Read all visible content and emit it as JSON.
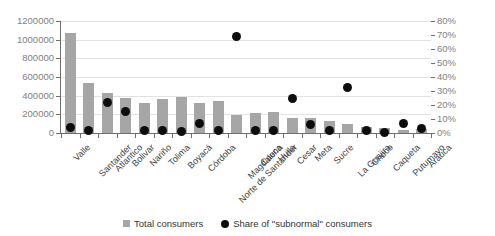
{
  "chart_data": {
    "type": "bar",
    "title": "",
    "subtitle": "",
    "xlabel": "",
    "ylabel": "",
    "y2label": "",
    "grid": true,
    "legend_position": "bottom",
    "categories": [
      "Valle",
      "Santander",
      "Atlantico",
      "Bolivar",
      "Nariño",
      "Tolima",
      "Boyacá",
      "Córdoba",
      "Norte de Santander",
      "Magdalena",
      "Cauca",
      "Huila",
      "Cesar",
      "Meta",
      "Sucre",
      "La Guajira",
      "Choco",
      "Caqueta",
      "Putumayo",
      "Arauca"
    ],
    "ylim": [
      0,
      1200000
    ],
    "yticks": [
      0,
      200000,
      400000,
      600000,
      800000,
      1000000,
      1200000
    ],
    "yticklabels": [
      "0",
      "200000",
      "400000",
      "600000",
      "800000",
      "1000000",
      "1200000"
    ],
    "y2lim": [
      0,
      0.8
    ],
    "y2ticks": [
      0,
      0.1,
      0.2,
      0.3,
      0.4,
      0.5,
      0.6,
      0.7,
      0.8
    ],
    "y2ticklabels": [
      "0%",
      "10%",
      "20%",
      "30%",
      "40%",
      "50%",
      "60%",
      "70%",
      "80%"
    ],
    "series": [
      {
        "name": "Total consumers",
        "type": "bar",
        "axis": "left",
        "color": "#a6a6a6",
        "values": [
          1075000,
          535000,
          430000,
          380000,
          320000,
          365000,
          390000,
          325000,
          340000,
          195000,
          215000,
          220000,
          160000,
          165000,
          125000,
          95000,
          60000,
          50000,
          30000,
          40000
        ]
      },
      {
        "name": "Share of \"subnormal\" consumers",
        "type": "scatter",
        "axis": "right",
        "color": "#0d0d0d",
        "values": [
          0.04,
          0.02,
          0.22,
          0.155,
          0.015,
          0.015,
          0.01,
          0.065,
          0.015,
          0.69,
          0.015,
          0.02,
          0.245,
          0.06,
          0.015,
          0.325,
          0.02,
          0.005,
          0.07,
          0.035
        ]
      }
    ]
  },
  "legend": {
    "items": [
      {
        "label": "Total consumers",
        "marker": "square-marker"
      },
      {
        "label": "Share of \"subnormal\" consumers",
        "marker": "circle-marker"
      }
    ]
  },
  "colors": {
    "bar": "#a6a6a6",
    "dot": "#0d0d0d",
    "grid": "#e2e2e2",
    "axis": "#6e6e6e",
    "tick_text": "#808080",
    "category_text": "#404040",
    "background": "#ffffff"
  }
}
